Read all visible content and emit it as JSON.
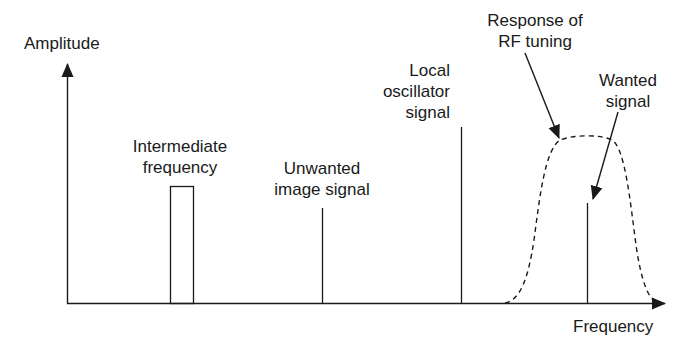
{
  "diagram": {
    "axes": {
      "y_label": "Amplitude",
      "x_label": "Frequency"
    },
    "labels": {
      "intermediate_frequency": [
        "Intermediate",
        "frequency"
      ],
      "unwanted_image": [
        "Unwanted",
        "image signal"
      ],
      "local_oscillator": [
        "Local",
        "oscillator",
        "signal"
      ],
      "rf_response": [
        "Response of",
        "RF tuning"
      ],
      "wanted_signal": [
        "Wanted",
        "signal"
      ]
    },
    "elements": [
      {
        "name": "Intermediate frequency",
        "shape": "rectangle",
        "x_range": [
          170,
          194
        ],
        "top_y": 186
      },
      {
        "name": "Unwanted image signal",
        "shape": "line",
        "x": 322,
        "top_y": 208
      },
      {
        "name": "Local oscillator signal",
        "shape": "line",
        "x": 461,
        "top_y": 127
      },
      {
        "name": "Wanted signal",
        "shape": "line",
        "x": 587,
        "top_y": 203
      },
      {
        "name": "Response of RF tuning",
        "shape": "dashed-curve",
        "x_range": [
          505,
          655
        ],
        "peak_y": 138
      }
    ],
    "colors": {
      "ink": "#1a1a1a",
      "background": "#ffffff"
    }
  }
}
